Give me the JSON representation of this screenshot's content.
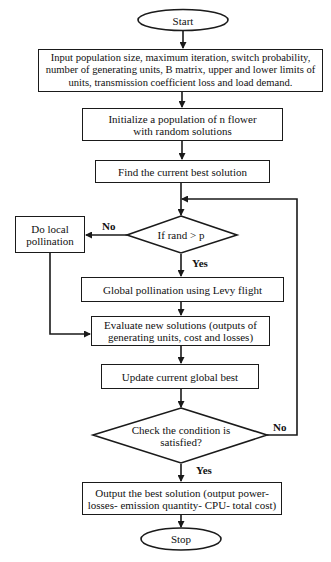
{
  "flowchart": {
    "start": "Start",
    "input": "Input population size, maximum iteration, switch probability, number of generating units, B matrix, upper and lower limits of units, transmission coefficient loss and load demand.",
    "initialize": "Initialize  a population  of n flower with random solutions",
    "find_best": "Find  the current best solution",
    "decision_rand": "If rand > p",
    "local_pollination": "Do local pollination",
    "global_pollination": "Global  pollination  using  Levy flight",
    "evaluate": "Evaluate new solutions (outputs of generating units, cost and losses)",
    "update": "Update current global best",
    "decision_condition": "Check the condition is satisfied?",
    "output": "Output the best solution (output power- losses- emission quantity- CPU- total cost)",
    "stop": "Stop"
  },
  "edge_labels": {
    "rand_no": "No",
    "rand_yes": "Yes",
    "condition_no": "No",
    "condition_yes": "Yes"
  },
  "colors": {
    "stroke": "#1a1a1a",
    "background": "#ffffff",
    "text": "#111111"
  }
}
